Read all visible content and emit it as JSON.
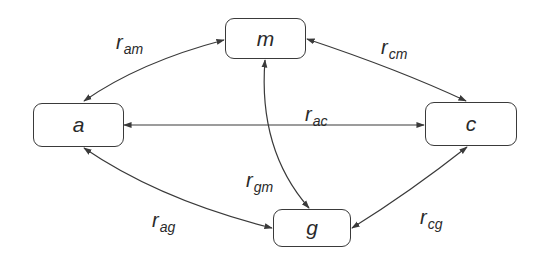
{
  "diagram": {
    "type": "undirected-relationship-graph",
    "nodes": [
      {
        "id": "a",
        "label": "a"
      },
      {
        "id": "m",
        "label": "m"
      },
      {
        "id": "c",
        "label": "c"
      },
      {
        "id": "g",
        "label": "g"
      }
    ],
    "edges": [
      {
        "from": "a",
        "to": "m",
        "label_main": "r",
        "label_sub": "am",
        "arrows": "both"
      },
      {
        "from": "c",
        "to": "m",
        "label_main": "r",
        "label_sub": "cm",
        "arrows": "both"
      },
      {
        "from": "a",
        "to": "c",
        "label_main": "r",
        "label_sub": "ac",
        "arrows": "both"
      },
      {
        "from": "g",
        "to": "m",
        "label_main": "r",
        "label_sub": "gm",
        "arrows": "both"
      },
      {
        "from": "a",
        "to": "g",
        "label_main": "r",
        "label_sub": "ag",
        "arrows": "both"
      },
      {
        "from": "c",
        "to": "g",
        "label_main": "r",
        "label_sub": "cg",
        "arrows": "both"
      }
    ]
  },
  "colors": {
    "stroke": "#3a3a3a",
    "text": "#2a2a2a",
    "background": "#ffffff"
  }
}
